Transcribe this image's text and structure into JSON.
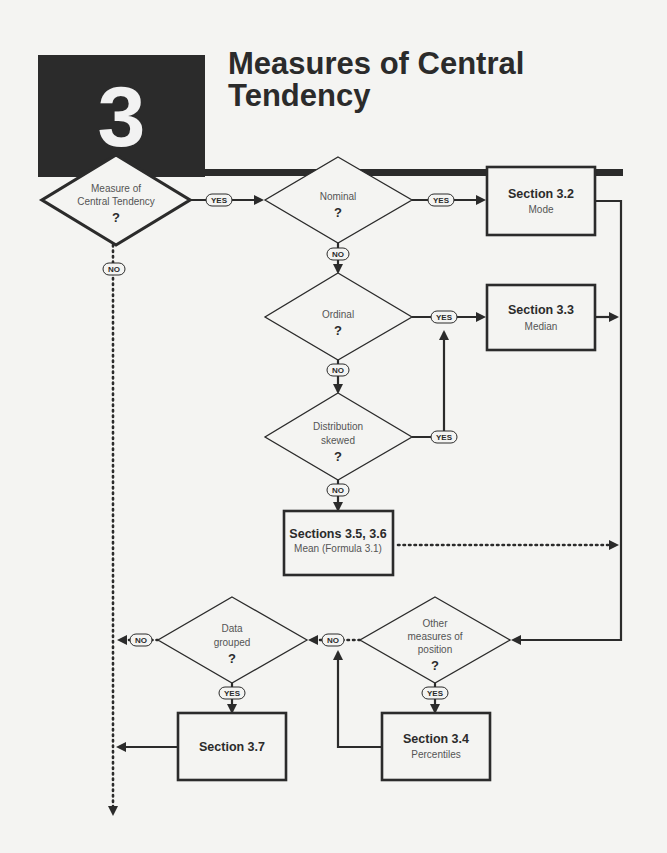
{
  "header": {
    "chapter_number": "3",
    "title_line1": "Measures of Central",
    "title_line2": "Tendency"
  },
  "diagram": {
    "decisions": {
      "central": {
        "line1": "Measure of",
        "line2": "Central Tendency",
        "q": "?"
      },
      "nominal": {
        "line1": "Nominal",
        "q": "?"
      },
      "ordinal": {
        "line1": "Ordinal",
        "q": "?"
      },
      "skewed": {
        "line1": "Distribution",
        "line2": "skewed",
        "q": "?"
      },
      "other": {
        "line1": "Other",
        "line2": "measures of",
        "line3": "position",
        "q": "?"
      },
      "grouped": {
        "line1": "Data",
        "line2": "grouped",
        "q": "?"
      }
    },
    "boxes": {
      "s32": {
        "title": "Section 3.2",
        "sub": "Mode"
      },
      "s33": {
        "title": "Section 3.3",
        "sub": "Median"
      },
      "s356": {
        "title": "Sections 3.5, 3.6",
        "sub": "Mean (Formula 3.1)"
      },
      "s34": {
        "title": "Section 3.4",
        "sub": "Percentiles"
      },
      "s37": {
        "title": "Section 3.7"
      }
    },
    "labels": {
      "yes": "YES",
      "no": "NO"
    }
  }
}
